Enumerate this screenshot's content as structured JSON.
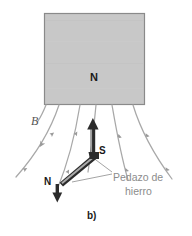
{
  "figure": {
    "panel_label": "b)",
    "background_color": "#ffffff",
    "width": 192,
    "height": 236
  },
  "magnet": {
    "pole_label": "N",
    "fill_color": "#c8c8c8",
    "edge_color": "#8a8a8a",
    "x": 44,
    "y": 13,
    "width": 101,
    "height": 92
  },
  "field": {
    "label": "B",
    "label_style": "italic",
    "line_color": "#a8a8a8",
    "arrow_marker_color": "#9a9a9a",
    "line_count": 6,
    "description": "magnetic field lines emerging downward from the magnet's N face and spreading outward"
  },
  "compass_needle": {
    "north_label": "N",
    "south_label": "S",
    "body_color": "#2b2b2b",
    "highlight_color": "#ffffff",
    "pivot_x": 96,
    "pivot_y": 155,
    "south_arrow_tip": {
      "x": 93,
      "y": 119
    },
    "north_arrow_tip": {
      "x": 57,
      "y": 201
    }
  },
  "callout": {
    "line1": "Pedazo de",
    "line2": "hierro",
    "text_color": "#8c8c8c",
    "leader_color": "#9a9a9a"
  },
  "colors": {
    "magnet_fill": "#c8c8c8",
    "field_line": "#a8a8a8",
    "needle_dark": "#2b2b2b",
    "callout_text": "#8c8c8c",
    "label_dark": "#1a1a1a"
  }
}
